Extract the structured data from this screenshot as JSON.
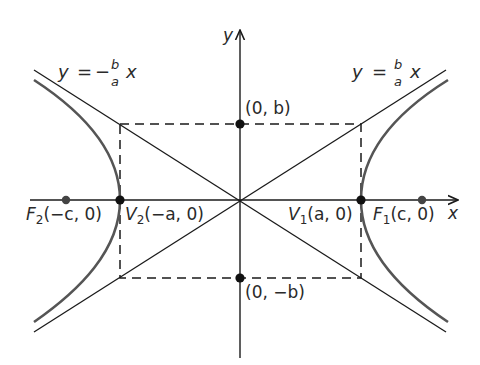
{
  "diagram": {
    "type": "hyperbola",
    "equation_form": "x^2/a^2 - y^2/b^2 = 1",
    "axes": {
      "x_label": "x",
      "y_label": "y"
    },
    "asymptotes": {
      "left": {
        "lhs": "y",
        "eq": "=",
        "sign": "−",
        "num": "b",
        "den": "a",
        "var": "x"
      },
      "right": {
        "lhs": "y",
        "eq": "=",
        "num": "b",
        "den": "a",
        "var": "x"
      }
    },
    "points": {
      "F2": {
        "name": "F",
        "sub": "2",
        "coords": "(−c, 0)"
      },
      "V2": {
        "name": "V",
        "sub": "2",
        "coords": "(−a, 0)"
      },
      "V1": {
        "name": "V",
        "sub": "1",
        "coords": "(a, 0)"
      },
      "F1": {
        "name": "F",
        "sub": "1",
        "coords": "(c, 0)"
      },
      "B1": {
        "coords": "(0, b)"
      },
      "B2": {
        "coords": "(0, −b)"
      }
    },
    "colors": {
      "line": "#1a1a1a",
      "curve": "#555555",
      "text": "#2a2a2a"
    }
  }
}
